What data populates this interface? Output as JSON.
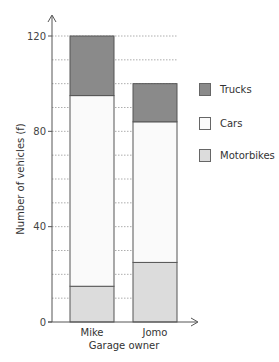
{
  "chart_data": {
    "type": "bar",
    "stacked": true,
    "title": "",
    "xlabel": "Garage owner",
    "ylabel": "Number of vehicles (f)",
    "categories": [
      "Mike",
      "Jomo"
    ],
    "series": [
      {
        "name": "Motorbikes",
        "values": [
          15,
          25
        ],
        "color": "#dcdcdc"
      },
      {
        "name": "Cars",
        "values": [
          80,
          59
        ],
        "color": "#fafafa"
      },
      {
        "name": "Trucks",
        "values": [
          25,
          16
        ],
        "color": "#8a8a8a"
      }
    ],
    "totals": [
      120,
      100
    ],
    "ylim": [
      0,
      120
    ],
    "y_ticks": [
      0,
      40,
      80,
      120
    ],
    "grid": {
      "on": true,
      "minor_step": 10,
      "style": "dotted"
    },
    "legend": {
      "position": "right",
      "order": [
        "Trucks",
        "Cars",
        "Motorbikes"
      ]
    }
  },
  "axes": {
    "x_title": "Garage owner",
    "y_title": "Number of vehicles (f)",
    "y_tick_labels": [
      "0",
      "40",
      "80",
      "120"
    ]
  },
  "legend": {
    "items": [
      {
        "label": "Trucks",
        "color": "#8a8a8a"
      },
      {
        "label": "Cars",
        "color": "#fafafa"
      },
      {
        "label": "Motorbikes",
        "color": "#dcdcdc"
      }
    ]
  }
}
